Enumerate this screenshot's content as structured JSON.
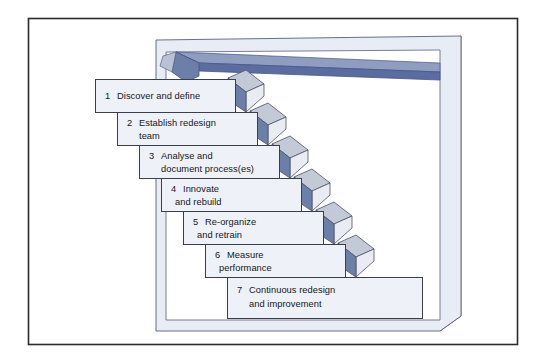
{
  "figure": {
    "frame": {
      "border_color": "#2b2b2b",
      "background": "#ffffff"
    },
    "palette": {
      "slab_face": "#e8ecf4",
      "slab_side": "#c3cbdc",
      "slab_outline": "#59617a",
      "top_bar": "#5a6d9e",
      "top_bar_dark": "#46568a",
      "box_fill": "#eef1f7",
      "box_outline": "#3a3f4a",
      "arrow_top_facet": "#c3c9d6",
      "arrow_side_facet": "#6b7fa8",
      "arrow_front_facet": "#e9ecf3",
      "text_color": "#15171c"
    }
  },
  "steps": [
    {
      "number": "1",
      "line1": "Discover and define",
      "line2": ""
    },
    {
      "number": "2",
      "line1": "Establish redesign",
      "line2": "team"
    },
    {
      "number": "3",
      "line1": "Analyse and",
      "line2": "document process(es)"
    },
    {
      "number": "4",
      "line1": "Innovate",
      "line2": "and rebuild"
    },
    {
      "number": "5",
      "line1": "Re-organize",
      "line2": "and retrain"
    },
    {
      "number": "6",
      "line1": "Measure",
      "line2": "performance"
    },
    {
      "number": "7",
      "line1": "Continuous redesign",
      "line2": "and improvement"
    }
  ]
}
